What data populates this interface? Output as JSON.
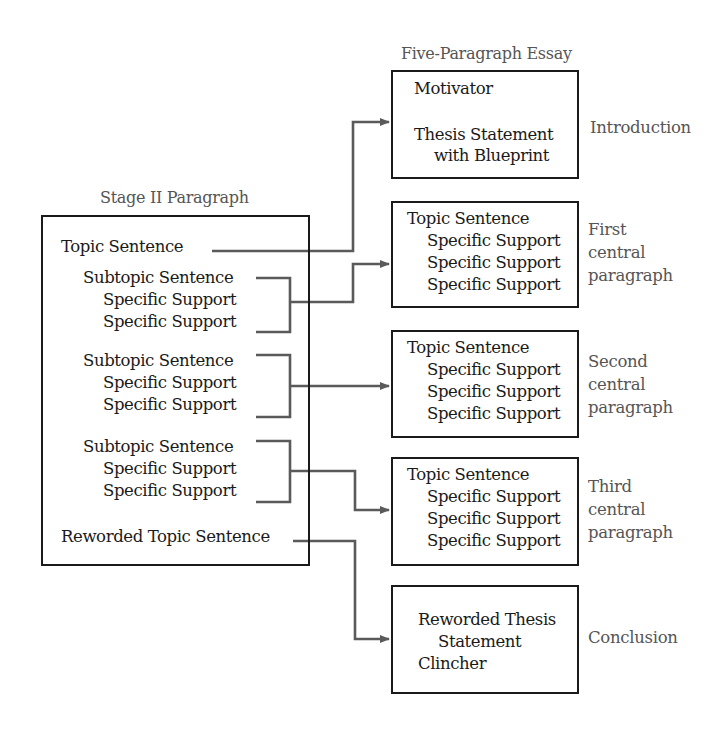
{
  "left_title": "Stage II Paragraph",
  "right_title": "Five-Paragraph Essay",
  "stage2": {
    "topic": "Topic Sentence",
    "groups": [
      {
        "subtopic": "Subtopic Sentence",
        "supports": [
          "Specific Support",
          "Specific Support"
        ]
      },
      {
        "subtopic": "Subtopic Sentence",
        "supports": [
          "Specific Support",
          "Specific Support"
        ]
      },
      {
        "subtopic": "Subtopic Sentence",
        "supports": [
          "Specific Support",
          "Specific Support"
        ]
      }
    ],
    "reworded": "Reworded Topic Sentence"
  },
  "essay": {
    "intro": {
      "lines": [
        "Motivator",
        "Thesis Statement",
        "with Blueprint"
      ],
      "label": "Introduction"
    },
    "central": [
      {
        "topic": "Topic Sentence",
        "supports": [
          "Specific Support",
          "Specific Support",
          "Specific Support"
        ],
        "label": [
          "First",
          "central",
          "paragraph"
        ]
      },
      {
        "topic": "Topic Sentence",
        "supports": [
          "Specific Support",
          "Specific Support",
          "Specific Support"
        ],
        "label": [
          "Second",
          "central",
          "paragraph"
        ]
      },
      {
        "topic": "Topic Sentence",
        "supports": [
          "Specific Support",
          "Specific Support",
          "Specific Support"
        ],
        "label": [
          "Third",
          "central",
          "paragraph"
        ]
      }
    ],
    "conclusion": {
      "lines": [
        "Reworded Thesis",
        "Statement",
        "Clincher"
      ],
      "label": "Conclusion"
    }
  },
  "colors": {
    "line": "#5a5a5a",
    "border": "#1a1a1a",
    "label": "#555555"
  }
}
